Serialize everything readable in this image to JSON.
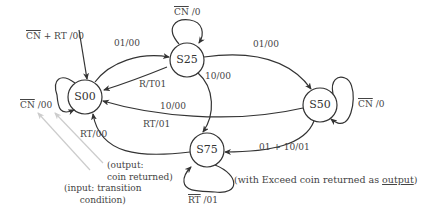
{
  "states": {
    "s00": "S00",
    "s25": "S25",
    "s50": "S50",
    "s75": "S75"
  },
  "transitions": {
    "entry": {
      "cn_bar": "CN",
      "rest": " + RT /00"
    },
    "s00_self": {
      "cn_bar": "CN",
      "rest": " /00"
    },
    "s00_to_s25": "01/00",
    "s25_self": {
      "cn_bar": "CN",
      "rest": " /0"
    },
    "s25_to_s00": "R/T01",
    "s25_to_s50": "01/00",
    "s25_to_s75": "10/00",
    "s50_to_s00_a": "10/00",
    "s50_to_s00_b": "RT/01",
    "s50_self": {
      "cn_bar": "CN",
      "rest": " /0"
    },
    "s50_to_s75": "01 + 10/01",
    "s75_to_s00": "RT/00",
    "s75_self": {
      "rt_bar": "RT",
      "rest": " /01"
    }
  },
  "annotations": {
    "output_line1": "(output:",
    "output_line2": "coin returned)",
    "input_line1": "(input: transition",
    "input_line2": "condition)",
    "note_prefix": "(with Exceed coin returned as ",
    "note_underlined": "output",
    "note_suffix": ")"
  },
  "colors": {
    "stroke": "#333333",
    "pointer": "#cccccc"
  }
}
